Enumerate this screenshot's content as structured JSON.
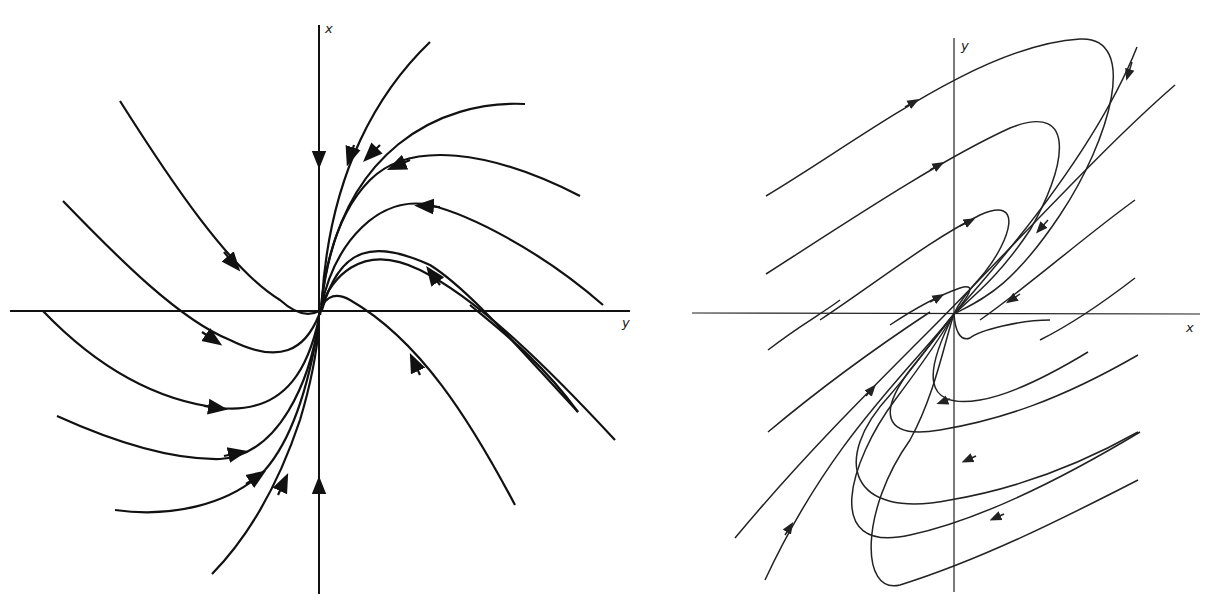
{
  "figure": {
    "left": {
      "title": "Phase portrait (left)",
      "vertical_axis_label": "x",
      "horizontal_axis_label": "y",
      "stroke_color": "#111111"
    },
    "right": {
      "title": "Phase portrait (right)",
      "vertical_axis_label": "y",
      "horizontal_axis_label": "x",
      "stroke_color": "#222222"
    }
  }
}
